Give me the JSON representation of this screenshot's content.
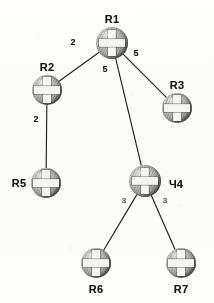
{
  "diagram": {
    "type": "weighted-tree",
    "node_icon": "router-sphere-cross-icon",
    "background_color": "#fbfbfa",
    "node_color": "#bdbdb9",
    "node_shade_color": "#1a1a19",
    "cross_color": "#f2f2ef",
    "edge_color": "#23231f",
    "label_color": "#151514"
  },
  "nodes": [
    {
      "id": "R1",
      "label": "R1",
      "x": 112,
      "y": 43,
      "r": 16,
      "label_x": 112,
      "label_y": 19
    },
    {
      "id": "R2",
      "label": "R2",
      "x": 47,
      "y": 90,
      "r": 15,
      "label_x": 47,
      "label_y": 67
    },
    {
      "id": "R3",
      "label": "R3",
      "x": 177,
      "y": 108,
      "r": 15,
      "label_x": 177,
      "label_y": 85
    },
    {
      "id": "R4",
      "label": "Ч4",
      "x": 145,
      "y": 181,
      "r": 16,
      "label_x": 176,
      "label_y": 184
    },
    {
      "id": "R5",
      "label": "R5",
      "x": 46,
      "y": 183,
      "r": 15,
      "label_x": 19,
      "label_y": 183
    },
    {
      "id": "R6",
      "label": "R6",
      "x": 96,
      "y": 263,
      "r": 15,
      "label_x": 96,
      "label_y": 289
    },
    {
      "id": "R7",
      "label": "R7",
      "x": 181,
      "y": 263,
      "r": 15,
      "label_x": 181,
      "label_y": 289
    }
  ],
  "edges": [
    {
      "from": "R1",
      "to": "R2",
      "weight": "2",
      "wx": 73,
      "wy": 42,
      "faint": false
    },
    {
      "from": "R1",
      "to": "R3",
      "weight": "5",
      "wx": 136,
      "wy": 53,
      "faint": false
    },
    {
      "from": "R1",
      "to": "R4",
      "weight": "5",
      "wx": 105,
      "wy": 69,
      "faint": false
    },
    {
      "from": "R2",
      "to": "R5",
      "weight": "2",
      "wx": 36,
      "wy": 119,
      "faint": false
    },
    {
      "from": "R4",
      "to": "R6",
      "weight": "3",
      "wx": 124,
      "wy": 200,
      "faint": true
    },
    {
      "from": "R4",
      "to": "R7",
      "weight": "3",
      "wx": 165,
      "wy": 200,
      "faint": true
    }
  ],
  "chart_data": {
    "type": "diagram",
    "root": "R1",
    "vertices": [
      "R1",
      "R2",
      "R3",
      "R4",
      "R5",
      "R6",
      "R7"
    ],
    "edges": [
      {
        "source": "R1",
        "target": "R2",
        "weight": 2
      },
      {
        "source": "R1",
        "target": "R3",
        "weight": 5
      },
      {
        "source": "R1",
        "target": "R4",
        "weight": 5
      },
      {
        "source": "R2",
        "target": "R5",
        "weight": 2
      },
      {
        "source": "R4",
        "target": "R6",
        "weight": 3
      },
      {
        "source": "R4",
        "target": "R7",
        "weight": 3
      }
    ],
    "legend": [],
    "xlabel": "",
    "ylabel": ""
  }
}
